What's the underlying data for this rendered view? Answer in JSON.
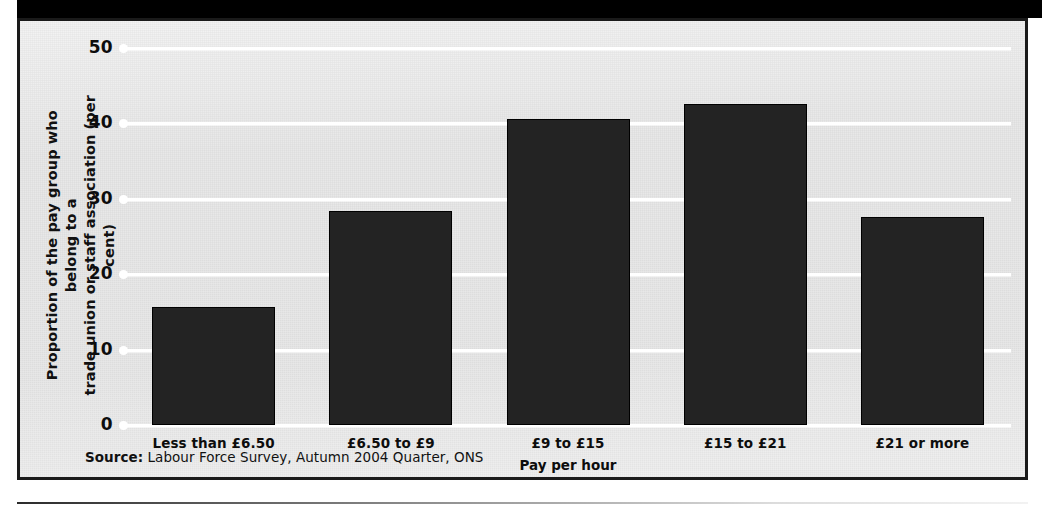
{
  "figure": {
    "y_axis_title": "Proportion of the pay group who belong to a\ntrade union or staff association (per cent)",
    "x_axis_title": "Pay per hour",
    "source_prefix": "Source:",
    "source_text": " Labour Force Survey, Autumn 2004 Quarter, ONS",
    "colors": {
      "bar": "#232323",
      "bar_border": "#000000",
      "panel_background": "#e7e7e7",
      "gridline": "#ffffff",
      "frame_border": "#1a1a1a",
      "text": "#0d0d0d"
    }
  },
  "chart_data": {
    "type": "bar",
    "title": "",
    "subtitle": "",
    "categories": [
      "Less than £6.50",
      "£6.50 to £9",
      "£9 to £15",
      "£15 to £21",
      "£21 or more"
    ],
    "values": [
      15.5,
      28.3,
      40.5,
      42.5,
      27.4
    ],
    "xlabel": "Pay per hour",
    "ylabel": "Proportion of the pay group who belong to a trade union or staff association (per cent)",
    "ylim": [
      0,
      50
    ],
    "yticks": [
      0,
      10,
      20,
      30,
      40,
      50
    ],
    "ytick_labels": [
      "0",
      "10",
      "20",
      "30",
      "40",
      "50"
    ],
    "grid": "horizontal",
    "legend": "none",
    "source": "Source: Labour Force Survey, Autumn 2004 Quarter, ONS"
  }
}
